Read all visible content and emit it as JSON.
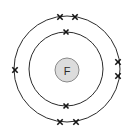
{
  "diagram": {
    "type": "bohr-electron-shell-diagram",
    "element_symbol": "F",
    "element_name": "Fluorine",
    "total_electrons": 9,
    "background_color": "#ffffff",
    "shell_line_color": "#2b2b2b",
    "electron_mark_color": "#151515",
    "nucleus": {
      "label": "F",
      "center_x": 67,
      "center_y": 70,
      "radius": 12,
      "fill_color": "#dcdcdc",
      "stroke_color": "#8a8a8a",
      "label_font_size": 11
    },
    "shells": [
      {
        "name": "inner-shell",
        "shell_number": 1,
        "shell_letter": "K",
        "center_x": 66,
        "center_y": 69,
        "radius": 37,
        "electron_count": 2,
        "electrons": [
          {
            "name": "electron-inner-top",
            "x": 66,
            "y": 32,
            "size": 5.0
          },
          {
            "name": "electron-inner-bottom",
            "x": 66,
            "y": 106,
            "size": 5.0
          }
        ]
      },
      {
        "name": "outer-shell",
        "shell_number": 2,
        "shell_letter": "L",
        "center_x": 67,
        "center_y": 69,
        "radius": 53,
        "electron_count": 7,
        "electrons": [
          {
            "name": "electron-outer-top-left",
            "x": 60,
            "y": 17,
            "size": 5.4
          },
          {
            "name": "electron-outer-top-right",
            "x": 75,
            "y": 17,
            "size": 5.4
          },
          {
            "name": "electron-outer-right-upper",
            "x": 118,
            "y": 62,
            "size": 5.4
          },
          {
            "name": "electron-outer-right-lower",
            "x": 118,
            "y": 76,
            "size": 5.4
          },
          {
            "name": "electron-outer-bottom-right",
            "x": 76,
            "y": 122,
            "size": 5.4
          },
          {
            "name": "electron-outer-bottom-left",
            "x": 60,
            "y": 122,
            "size": 5.4
          },
          {
            "name": "electron-outer-left",
            "x": 15,
            "y": 70,
            "size": 5.4
          }
        ]
      }
    ]
  }
}
